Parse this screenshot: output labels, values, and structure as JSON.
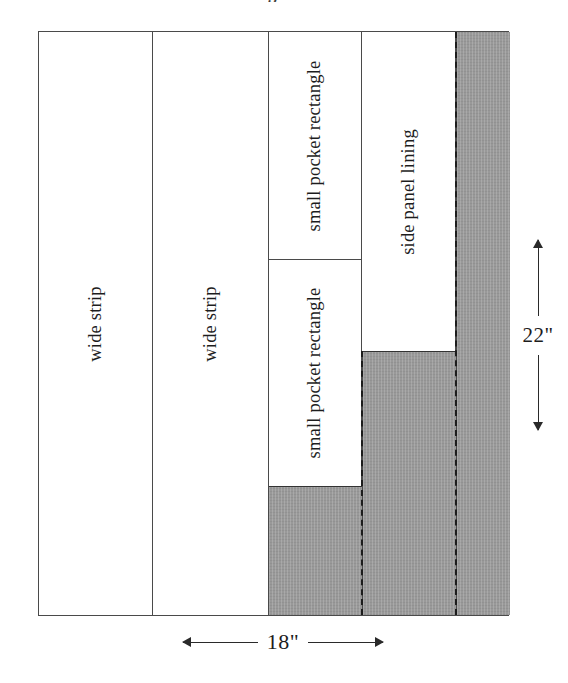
{
  "title_fragment": "g",
  "diagram": {
    "name": "fabric cutting layout",
    "sheet": {
      "width_label": "18\"",
      "height_label": "22\""
    },
    "pieces": [
      {
        "id": "wide-strip-1",
        "label": "wide strip"
      },
      {
        "id": "wide-strip-2",
        "label": "wide strip"
      },
      {
        "id": "small-pocket-top",
        "label": "small pocket rectangle"
      },
      {
        "id": "small-pocket-bottom",
        "label": "small pocket rectangle"
      },
      {
        "id": "side-panel-lining",
        "label": "side panel lining"
      }
    ],
    "scrap_regions": [
      {
        "id": "scrap-column-3"
      },
      {
        "id": "scrap-column-4"
      },
      {
        "id": "scrap-column-5"
      }
    ],
    "guides": [
      {
        "id": "dashed-guide-left"
      },
      {
        "id": "dashed-guide-right"
      }
    ],
    "colors": {
      "scrap_fill": "#999999",
      "outline": "#4a4a4a",
      "piece_fill": "#ffffff",
      "guide": "#1c1c1c",
      "text": "#1d1d1d"
    }
  }
}
